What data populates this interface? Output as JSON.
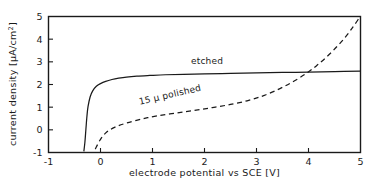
{
  "chart_data": {
    "type": "line",
    "title": "",
    "xlabel": "electrode  potential  vs SCE [V]",
    "ylabel": "current density [µA/cm",
    "ylabel_sup": "2",
    "ylabel_close": "]",
    "xlim": [
      -1,
      5
    ],
    "ylim": [
      -1,
      5
    ],
    "xticks": [
      -1,
      0,
      1,
      2,
      3,
      4,
      5
    ],
    "xticklabels": [
      "-1",
      "0",
      "1",
      "2",
      "3",
      "4",
      "5"
    ],
    "yticks": [
      -1,
      0,
      1,
      2,
      3,
      4,
      5
    ],
    "yticklabels": [
      "-1",
      "0",
      "1",
      "2",
      "3",
      "4",
      "5"
    ],
    "grid": false,
    "legend_position": "inline-annotations",
    "series": [
      {
        "name": "etched",
        "style": "solid",
        "color": "#1a1a1a",
        "label": "etched",
        "label_x": 2.05,
        "label_y": 2.92,
        "x": [
          -0.32,
          -0.3,
          -0.28,
          -0.26,
          -0.24,
          -0.2,
          -0.15,
          -0.08,
          0.0,
          0.1,
          0.22,
          0.35,
          0.5,
          0.7,
          0.95,
          1.25,
          1.6,
          2.0,
          2.5,
          3.0,
          3.5,
          4.0,
          4.5,
          5.0
        ],
        "y": [
          -0.95,
          -0.55,
          0.05,
          0.62,
          1.02,
          1.45,
          1.72,
          1.92,
          2.04,
          2.14,
          2.22,
          2.28,
          2.33,
          2.37,
          2.4,
          2.43,
          2.45,
          2.47,
          2.49,
          2.51,
          2.53,
          2.55,
          2.57,
          2.59
        ]
      },
      {
        "name": "15 µ polished",
        "style": "dashed",
        "color": "#1a1a1a",
        "label": "15 µ polished",
        "label_x": 1.35,
        "label_y": 1.42,
        "label_rotation": -13,
        "x": [
          -0.1,
          0.0,
          0.12,
          0.28,
          0.5,
          0.8,
          1.1,
          1.45,
          1.8,
          2.15,
          2.5,
          2.85,
          3.15,
          3.45,
          3.7,
          3.95,
          4.15,
          4.35,
          4.55,
          4.72,
          4.86,
          4.97
        ],
        "y": [
          -0.85,
          -0.42,
          -0.1,
          0.12,
          0.3,
          0.48,
          0.62,
          0.74,
          0.86,
          0.98,
          1.12,
          1.3,
          1.52,
          1.82,
          2.12,
          2.48,
          2.82,
          3.22,
          3.68,
          4.12,
          4.55,
          4.92
        ]
      }
    ]
  }
}
